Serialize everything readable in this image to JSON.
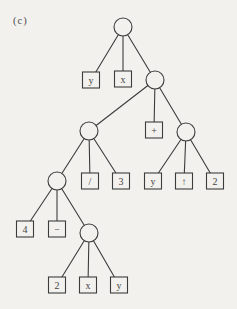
{
  "figure_label": "(c)",
  "colors": {
    "paper": "#f2f1ee",
    "ink": "#3c3c3c",
    "text": "#444444"
  },
  "tree": {
    "description": "expression-tree",
    "circle_radius": 9,
    "square_width": 17,
    "square_height": 16,
    "nodes": [
      {
        "id": "root",
        "type": "circle",
        "x": 123,
        "y": 27,
        "label": ""
      },
      {
        "id": "leaf-y-1",
        "type": "square",
        "x": 91,
        "y": 80,
        "label": "y"
      },
      {
        "id": "leaf-x-1",
        "type": "square",
        "x": 123,
        "y": 79,
        "label": "x"
      },
      {
        "id": "op-2",
        "type": "circle",
        "x": 155,
        "y": 80,
        "label": ""
      },
      {
        "id": "op-3",
        "type": "circle",
        "x": 89,
        "y": 131,
        "label": ""
      },
      {
        "id": "leaf-plus",
        "type": "square",
        "x": 154,
        "y": 130,
        "label": "+"
      },
      {
        "id": "op-4",
        "type": "circle",
        "x": 186,
        "y": 132,
        "label": ""
      },
      {
        "id": "op-5",
        "type": "circle",
        "x": 57,
        "y": 181,
        "label": ""
      },
      {
        "id": "leaf-slash",
        "type": "square",
        "x": 90,
        "y": 181,
        "label": "/"
      },
      {
        "id": "leaf-3",
        "type": "square",
        "x": 121,
        "y": 181,
        "label": "3"
      },
      {
        "id": "leaf-y-2",
        "type": "square",
        "x": 153,
        "y": 181,
        "label": "y"
      },
      {
        "id": "leaf-up",
        "type": "square",
        "x": 184,
        "y": 181,
        "label": "↑"
      },
      {
        "id": "leaf-2-a",
        "type": "square",
        "x": 215,
        "y": 181,
        "label": "2"
      },
      {
        "id": "leaf-4",
        "type": "square",
        "x": 25,
        "y": 229,
        "label": "4"
      },
      {
        "id": "leaf-minus",
        "type": "square",
        "x": 57,
        "y": 229,
        "label": "−"
      },
      {
        "id": "op-6",
        "type": "circle",
        "x": 89,
        "y": 233,
        "label": ""
      },
      {
        "id": "leaf-2-b",
        "type": "square",
        "x": 57,
        "y": 285,
        "label": "2"
      },
      {
        "id": "leaf-x-2",
        "type": "square",
        "x": 88,
        "y": 285,
        "label": "x"
      },
      {
        "id": "leaf-y-3",
        "type": "square",
        "x": 119,
        "y": 285,
        "label": "y"
      }
    ],
    "edges": [
      [
        "root",
        "leaf-y-1"
      ],
      [
        "root",
        "leaf-x-1"
      ],
      [
        "root",
        "op-2"
      ],
      [
        "op-2",
        "op-3"
      ],
      [
        "op-2",
        "leaf-plus"
      ],
      [
        "op-2",
        "op-4"
      ],
      [
        "op-3",
        "op-5"
      ],
      [
        "op-3",
        "leaf-slash"
      ],
      [
        "op-3",
        "leaf-3"
      ],
      [
        "op-4",
        "leaf-y-2"
      ],
      [
        "op-4",
        "leaf-up"
      ],
      [
        "op-4",
        "leaf-2-a"
      ],
      [
        "op-5",
        "leaf-4"
      ],
      [
        "op-5",
        "leaf-minus"
      ],
      [
        "op-5",
        "op-6"
      ],
      [
        "op-6",
        "leaf-2-b"
      ],
      [
        "op-6",
        "leaf-x-2"
      ],
      [
        "op-6",
        "leaf-y-3"
      ]
    ]
  }
}
